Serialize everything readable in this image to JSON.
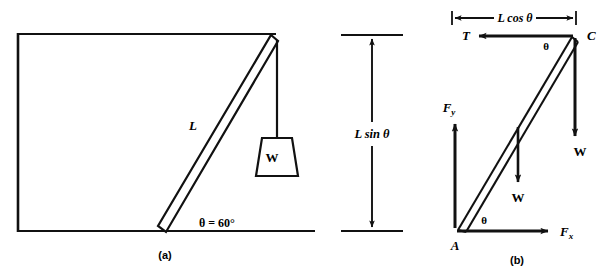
{
  "figure": {
    "background": "#ffffff",
    "ink": "#111111",
    "panels": [
      {
        "id": "a",
        "caption": "(a)",
        "name": "beam-against-wall-diagram",
        "labels": {
          "beam_length": "L",
          "angle": "θ = 60°",
          "hanging_weight": "W"
        }
      },
      {
        "id": "dimension",
        "name": "vertical-height-dimension",
        "labels": {
          "height": "L sin θ"
        }
      },
      {
        "id": "b",
        "caption": "(b)",
        "name": "free-body-diagram",
        "labels": {
          "span": "L cos θ",
          "tension": "T",
          "point_top": "C",
          "point_bottom": "A",
          "angle_top": "θ",
          "angle_bottom": "θ",
          "force_x": "F",
          "force_x_sub": "x",
          "force_y": "F",
          "force_y_sub": "y",
          "beam_weight": "W",
          "hanging_weight": "W"
        }
      }
    ]
  }
}
